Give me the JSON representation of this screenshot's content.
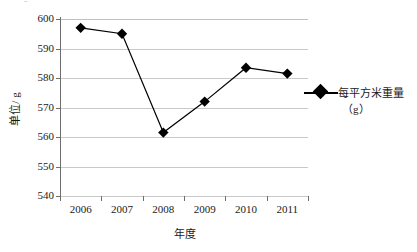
{
  "chart_data": {
    "type": "line",
    "title": "",
    "subtitle": "",
    "xlabel": "年度",
    "ylabel": "单位/ g",
    "categories": [
      "2006",
      "2007",
      "2008",
      "2009",
      "2010",
      "2011"
    ],
    "series": [
      {
        "name": "每平方米重量（g）",
        "values": [
          597,
          595,
          561.5,
          572,
          583.5,
          581.5
        ],
        "color": "#000000",
        "marker": "diamond"
      }
    ],
    "ylim": [
      540,
      600
    ],
    "yticks": [
      540,
      550,
      560,
      570,
      580,
      590,
      600
    ],
    "ytick_labels": [
      "540",
      "550",
      "560",
      "570",
      "580",
      "590",
      "600"
    ],
    "grid": true,
    "grid_axis": "y",
    "legend": {
      "position": "right",
      "entries": [
        {
          "label_line1": "每平方米重量",
          "label_line2": "（g）"
        }
      ]
    },
    "annotations": []
  },
  "artifact": {
    "top_left_fragment": "ｰ"
  }
}
